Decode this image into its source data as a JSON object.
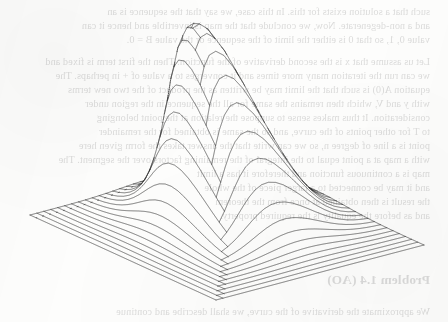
{
  "page": {
    "width": 448,
    "height": 322,
    "background_color": "#fdfdfc",
    "medium": "scanned book page"
  },
  "figure": {
    "name": "gaussian-surface-wireframe",
    "kind": "3d-wireframe-surface-plot",
    "line_color": "#262626",
    "line_width": 0.62,
    "axes_visible": false,
    "ticks_visible": false,
    "labels_visible": false,
    "caption": ""
  },
  "bleed_through": {
    "description": "faint mirrored show-through of printed text from the reverse side of the page",
    "color": "#8d8d8d",
    "opacity": 0.3,
    "mirrored": true,
    "heading": "Problem 1.4 (AO)",
    "lines": [
      {
        "text": "such that a solution exists for this. In this case, we say that the sequence is an",
        "x": 18,
        "y": 6
      },
      {
        "text": "and a non-degenerate. Now, we conclude that the map is invertible and hence it can",
        "x": 18,
        "y": 20
      },
      {
        "text": "value 0, 1, so that 0 is either the limit of the sequence or the value B = 0.",
        "x": 18,
        "y": 34
      },
      {
        "text": "Let us assume that x is the second derivative of the function. Then the first term is fixed and",
        "x": 18,
        "y": 56
      },
      {
        "text": "we can run the iteration many more times and it converges to a value of + in perhaps. The",
        "x": 18,
        "y": 70
      },
      {
        "text": "equation A(0) is such that the limit may be written as the product of the two new terms",
        "x": 18,
        "y": 84
      },
      {
        "text": "with y and V, which then remains the same for all the sequence in the region under",
        "x": 18,
        "y": 98
      },
      {
        "text": "consideration. It thus makes sense to suppose the relation at the point belonging",
        "x": 18,
        "y": 112
      },
      {
        "text": "to T for other points of the curve, and so the same is obtained for the remainder",
        "x": 18,
        "y": 126
      },
      {
        "text": "point is a line of degree n, so we can write that the answer takes the form given here",
        "x": 18,
        "y": 140
      },
      {
        "text": "with a map at a point equal to the integral of the remaining factors over the segment. The",
        "x": 18,
        "y": 154
      },
      {
        "text": "map is a continuous function and therefore it has a limit",
        "x": 18,
        "y": 168
      },
      {
        "text": "and it may be connected to a larger piece of the whole",
        "x": 18,
        "y": 182
      },
      {
        "text": "the result is then obtained at once from the theorem",
        "x": 18,
        "y": 196
      },
      {
        "text": "and as before the equality is the required property.",
        "x": 18,
        "y": 210
      },
      {
        "text": "We approximate the derivative of the curve, we shall describe and continue",
        "x": 18,
        "y": 306
      }
    ],
    "heading_position": {
      "x": 18,
      "y": 272
    }
  },
  "chart_data": {
    "type": "surface",
    "title": "",
    "subtitle": "",
    "xlabel": "",
    "ylabel": "",
    "zlabel": "",
    "surface_function": "z = exp(-((x-cx)^2 + (y-cy)^2) / (2*s^2))",
    "grid": {
      "nx": 30,
      "ny": 30,
      "u_lines": 31,
      "v_lines": 31
    },
    "domain": {
      "x": [
        -3.0,
        3.0
      ],
      "y": [
        -3.0,
        3.0
      ]
    },
    "zlim": [
      0,
      1
    ],
    "peak": {
      "x": -0.45,
      "y": 0.55,
      "z": 1.0
    },
    "sigma": 0.92,
    "projection": {
      "type": "oblique-parallel",
      "elevation_deg": 28,
      "azimuth_deg": 38,
      "z_scale": 1.0
    },
    "screen_corners": {
      "left": {
        "x": 30,
        "y": 215
      },
      "front": {
        "x": 216,
        "y": 300
      },
      "right": {
        "x": 420,
        "y": 240
      },
      "back": {
        "x": 238,
        "y": 160
      }
    },
    "apex_screen": {
      "x": 196,
      "y": 23
    },
    "grid_on": false,
    "legend": null,
    "legend_position": "none",
    "annotations": []
  }
}
